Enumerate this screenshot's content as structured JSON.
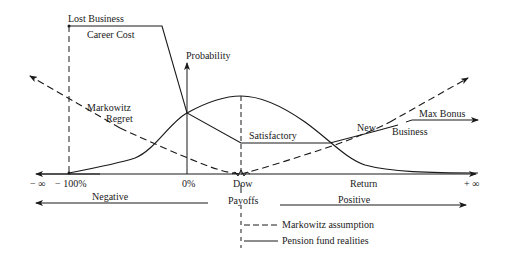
{
  "diagram": {
    "labels": {
      "lost_business": "Lost Business",
      "career_cost": "Career Cost",
      "probability": "Probability",
      "markowitz": "Markowitz",
      "regret": "Regret",
      "satisfactory": "Satisfactory",
      "new": "New",
      "business": "Business",
      "max_bonus": "Max Bonus",
      "minus_infinity": "− ∞",
      "minus_100": "− 100%",
      "zero_pct": "0%",
      "dow": "Dow",
      "return": "Return",
      "plus_infinity": "+ ∞",
      "negative": "Negative",
      "payoffs": "Payoffs",
      "positive": "Positive"
    },
    "legend": [
      {
        "style": "dashed",
        "label": "Markowitz assumption"
      },
      {
        "style": "solid",
        "label": "Pension fund realities"
      }
    ],
    "colors": {
      "ink": "#1a1a1a",
      "background": "#ffffff"
    }
  }
}
